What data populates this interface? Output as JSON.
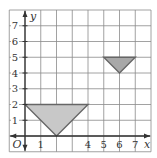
{
  "chart_data": {
    "type": "coordinate-grid",
    "xlabel": "x",
    "ylabel": "y",
    "origin_label": "O",
    "xlim": [
      -1,
      8
    ],
    "ylim": [
      -1,
      8
    ],
    "grid": true,
    "x_tick_labels": [
      {
        "value": 1,
        "label": "1"
      },
      {
        "value": 4,
        "label": "4"
      },
      {
        "value": 5,
        "label": "5"
      },
      {
        "value": 6,
        "label": "6"
      },
      {
        "value": 7,
        "label": "7"
      }
    ],
    "y_tick_labels": [
      {
        "value": 1,
        "label": "1"
      },
      {
        "value": 2,
        "label": "2"
      },
      {
        "value": 3,
        "label": "3"
      },
      {
        "value": 4,
        "label": "4"
      },
      {
        "value": 5,
        "label": "5"
      },
      {
        "value": 6,
        "label": "6"
      },
      {
        "value": 7,
        "label": "7"
      }
    ],
    "shapes": [
      {
        "name": "large-triangle",
        "vertices": [
          [
            0,
            2
          ],
          [
            4,
            2
          ],
          [
            2,
            0
          ]
        ],
        "fill": "#c8c8c8",
        "stroke": "#666666"
      },
      {
        "name": "small-triangle",
        "vertices": [
          [
            5,
            5
          ],
          [
            7,
            5
          ],
          [
            6,
            4
          ]
        ],
        "fill": "#a8a8a8",
        "stroke": "#666666"
      }
    ]
  },
  "colors": {
    "grid": "#8a8a8a",
    "axis": "#333333",
    "background": "#ffffff"
  }
}
